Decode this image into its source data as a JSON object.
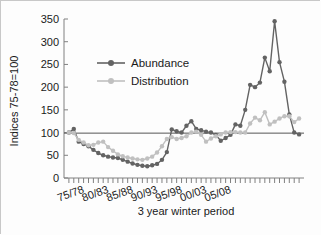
{
  "chart_data": {
    "type": "line",
    "title": "",
    "xlabel": "3 year winter period",
    "ylabel": "Indices  75-78=100",
    "ylim": [
      0,
      350
    ],
    "yticks": [
      0,
      50,
      100,
      150,
      200,
      250,
      300,
      350
    ],
    "xtick_labels": [
      "75/78",
      "80/83",
      "85/88",
      "90/93",
      "95/98",
      "00/03",
      "05/08"
    ],
    "xtick_indices": [
      0,
      5,
      10,
      15,
      20,
      25,
      30
    ],
    "x": [
      0,
      1,
      2,
      3,
      4,
      5,
      6,
      7,
      8,
      9,
      10,
      11,
      12,
      13,
      14,
      15,
      16,
      17,
      18,
      19,
      20,
      21,
      22,
      23,
      24,
      25,
      26,
      27,
      28,
      29,
      30,
      31,
      32,
      33
    ],
    "grid": false,
    "reference_line": 100,
    "legend_position": "upper-left-inside",
    "series": [
      {
        "name": "Abundance",
        "color": "#636363",
        "marker": "diamond",
        "values": [
          100,
          108,
          80,
          75,
          70,
          62,
          55,
          50,
          47,
          45,
          44,
          40,
          36,
          32,
          29,
          27,
          26,
          28,
          31,
          40,
          57,
          107,
          103,
          100,
          115,
          125,
          108,
          105,
          102,
          100,
          95,
          82,
          88,
          95
        ]
      },
      {
        "name": "Distribution",
        "color": "#c0c0c0",
        "marker": "diamond",
        "values": [
          100,
          99,
          84,
          78,
          72,
          73,
          78,
          80,
          68,
          60,
          52,
          48,
          45,
          43,
          41,
          40,
          43,
          47,
          56,
          70,
          86,
          90,
          86,
          88,
          92,
          100,
          102,
          95,
          80,
          87,
          92,
          96,
          100,
          101
        ]
      }
    ],
    "series_continued": [
      {
        "name": "Abundance",
        "values_tail": [
          118,
          115,
          150,
          205,
          200,
          210,
          265,
          235,
          345,
          255,
          212,
          140,
          100,
          96
        ]
      },
      {
        "name": "Distribution",
        "values_tail": [
          101,
          100,
          100,
          120,
          133,
          127,
          145,
          118,
          124,
          131,
          136,
          136,
          123,
          131
        ]
      }
    ]
  },
  "legend": {
    "items": [
      {
        "label": "Abundance",
        "color": "#636363"
      },
      {
        "label": "Distribution",
        "color": "#c0c0c0"
      }
    ]
  },
  "axes": {
    "y_label": "Indices  75-78=100",
    "x_label": "3 year winter period",
    "y_ticks": [
      "350",
      "300",
      "250",
      "200",
      "150",
      "100",
      "50",
      "0"
    ],
    "x_ticks": [
      "75/78",
      "80/83",
      "85/88",
      "90/93",
      "95/98",
      "00/03",
      "05/08"
    ]
  }
}
